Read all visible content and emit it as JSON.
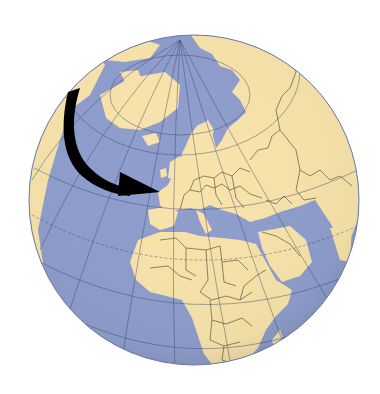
{
  "map": {
    "type": "orthographic-globe",
    "region_centered": "Europe / Africa",
    "colors": {
      "background": "#ffffff",
      "ocean": "#8e9dcc",
      "land": "#f7e3aa",
      "borders": "#3a3324",
      "graticule": "#3b4668",
      "arrow": "#000000"
    },
    "annotation": {
      "kind": "curved-arrow",
      "from": "North Atlantic / Greenland",
      "to": "France (Western Europe)"
    }
  }
}
